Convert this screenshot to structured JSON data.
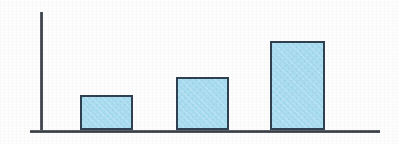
{
  "chart_data": {
    "type": "bar",
    "title": "",
    "subtitle": "",
    "xlabel": "",
    "ylabel": "",
    "categories": [
      "1",
      "2",
      "3"
    ],
    "values": [
      36,
      54,
      90
    ],
    "value_unit": "px-height",
    "series": [
      {
        "name": "",
        "values": [
          36,
          54,
          90
        ]
      }
    ],
    "ylim": [
      0,
      120
    ],
    "grid": false,
    "legend": false,
    "legend_position": "none",
    "tick_labels_x": [],
    "tick_labels_y": [],
    "annotations": [],
    "bars": [
      {
        "category": "1",
        "value": 36,
        "x": 80,
        "width": 53,
        "top": 95
      },
      {
        "category": "2",
        "value": 54,
        "x": 176,
        "width": 53,
        "top": 77
      },
      {
        "category": "3",
        "value": 90,
        "x": 270,
        "width": 55,
        "top": 41
      }
    ],
    "axes": {
      "y_axis": {
        "x": 40,
        "top": 12,
        "bottom": 132,
        "thickness": 2.5
      },
      "x_axis": {
        "y": 130,
        "left": 30,
        "right": 380,
        "thickness": 2.5
      }
    },
    "colors": {
      "bar_fill": "#a8dcf0",
      "bar_stroke": "#2f4050",
      "axis": "#4a4f56",
      "background": "#fdfdfd"
    }
  }
}
